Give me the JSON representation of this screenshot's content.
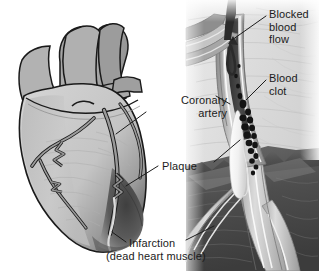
{
  "figure": {
    "type": "medical-illustration",
    "panels": {
      "left": "heart-with-coronary-arteries",
      "right": "coronary-artery-cross-section"
    },
    "background_color": "#ffffff",
    "palette": {
      "heart_body": "#c6c6c6",
      "heart_shadow": "#8f8f8f",
      "great_vessels": "#a8a8a8",
      "outline": "#1a1a1a",
      "infarct_dark": "#4a4a4a",
      "artery_wall": "#b4b4b4",
      "artery_wall_dark": "#7d7d7d",
      "blood_dark": "#3a3a3a",
      "clot_black": "#111111",
      "plaque_white": "#f5f5f5",
      "muscle_band": "#555555",
      "label_text": "#1b1b1b"
    }
  },
  "labels": {
    "blocked_blood_flow": "Blocked\nblood\nflow",
    "blood_clot": "Blood\nclot",
    "coronary_artery": "Coronary\nartery",
    "plaque": "Plaque",
    "infarction": "Infarction",
    "infarction_sub": "(dead heart muscle)"
  }
}
